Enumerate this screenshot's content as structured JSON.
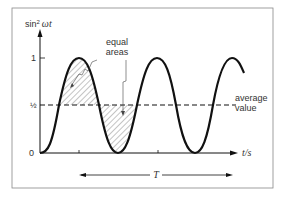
{
  "figure": {
    "y_axis_label_prefix": "sin",
    "y_axis_label_sup": "2",
    "y_axis_label_var": "ωt",
    "x_axis_label": "t/s",
    "tick_one": "1",
    "tick_half": "½",
    "tick_zero": "0",
    "annotation_equal_areas_line1": "equal",
    "annotation_equal_areas_line2": "areas",
    "annotation_average_line1": "average",
    "annotation_average_line2": "value",
    "period_label": "T"
  },
  "colors": {
    "curve": "#111111",
    "frame": "#888888",
    "text": "#333333",
    "hatch": "#555555"
  }
}
